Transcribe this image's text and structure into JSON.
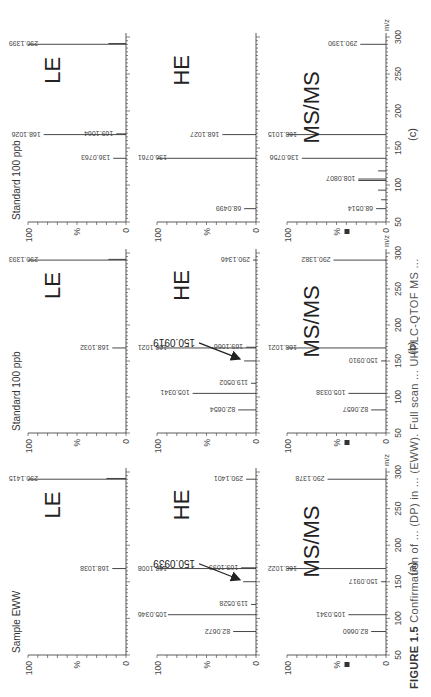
{
  "figure": {
    "caption_label": "FIGURE 1.5",
    "caption_text": "Confirmation of ... (DP) in ... (EWW). Full scan ... UHPLC-QTOF MS ..."
  },
  "chart_data": [
    {
      "type": "bar",
      "subtype": "mass_spectrum",
      "column": "(a)",
      "column_title": "Sample EWW",
      "panel": "LE",
      "xlabel": "m/z",
      "ylabel": "%",
      "xlim": [
        50,
        300
      ],
      "ylim": [
        0,
        100
      ],
      "xticks": [
        50,
        100,
        150,
        200,
        250,
        300
      ],
      "yticks": [
        0,
        100
      ],
      "peaks": [
        {
          "mz": 168.1038,
          "intensity": 14,
          "label": "168.1038"
        },
        {
          "mz": 290.1415,
          "intensity": 100,
          "label": "290.1415"
        },
        {
          "mz": 291.14,
          "intensity": 20
        }
      ]
    },
    {
      "type": "bar",
      "subtype": "mass_spectrum",
      "column": "(a)",
      "panel": "HE",
      "xlabel": "m/z",
      "ylabel": "%",
      "xlim": [
        50,
        300
      ],
      "ylim": [
        0,
        100
      ],
      "xticks": [
        50,
        100,
        150,
        200,
        250,
        300
      ],
      "yticks": [
        0,
        100
      ],
      "annotation": {
        "text": "150.0939",
        "arrow_to_mz": 150.0939
      },
      "peaks": [
        {
          "mz": 82.0672,
          "intensity": 23,
          "label": "82.0672"
        },
        {
          "mz": 105.0346,
          "intensity": 89,
          "label": "105.0346"
        },
        {
          "mz": 119.0528,
          "intensity": 5,
          "label": "119.0528"
        },
        {
          "mz": 150.0939,
          "intensity": 13
        },
        {
          "mz": 168.1008,
          "intensity": 100,
          "label": "168.1008"
        },
        {
          "mz": 169.1099,
          "intensity": 15,
          "label": "169.1099"
        },
        {
          "mz": 290.1401,
          "intensity": 10,
          "label": "290.1401"
        }
      ]
    },
    {
      "type": "bar",
      "subtype": "mass_spectrum",
      "column": "(a)",
      "panel": "MS/MS",
      "xlabel": "m/z",
      "ylabel": "%",
      "xlim": [
        50,
        300
      ],
      "ylim": [
        0,
        100
      ],
      "xticks": [
        50,
        100,
        150,
        200,
        250,
        300
      ],
      "yticks": [
        0,
        100
      ],
      "peaks": [
        {
          "mz": 82.066,
          "intensity": 15,
          "label": "82.0660"
        },
        {
          "mz": 105.0341,
          "intensity": 38,
          "label": "105.0341"
        },
        {
          "mz": 150.0917,
          "intensity": 5,
          "label": "150.0917"
        },
        {
          "mz": 168.1022,
          "intensity": 100,
          "label": "168.1022"
        },
        {
          "mz": 290.1378,
          "intensity": 59,
          "label": "290.1378"
        }
      ]
    },
    {
      "type": "bar",
      "subtype": "mass_spectrum",
      "column": "(b)",
      "column_title": "Standard 100 ppb",
      "panel": "LE",
      "xlabel": "m/z",
      "ylabel": "%",
      "xlim": [
        50,
        300
      ],
      "ylim": [
        0,
        100
      ],
      "xticks": [
        50,
        100,
        150,
        200,
        250,
        300
      ],
      "yticks": [
        0,
        100
      ],
      "peaks": [
        {
          "mz": 168.1032,
          "intensity": 14,
          "label": "168.1032"
        },
        {
          "mz": 290.1393,
          "intensity": 100,
          "label": "290.1393"
        },
        {
          "mz": 291.14,
          "intensity": 18
        }
      ]
    },
    {
      "type": "bar",
      "subtype": "mass_spectrum",
      "column": "(b)",
      "panel": "HE",
      "xlabel": "m/z",
      "ylabel": "%",
      "xlim": [
        50,
        300
      ],
      "ylim": [
        0,
        100
      ],
      "xticks": [
        50,
        100,
        150,
        200,
        250,
        300
      ],
      "yticks": [
        0,
        100
      ],
      "annotation": {
        "text": "150.0919",
        "arrow_to_mz": 150.0919
      },
      "peaks": [
        {
          "mz": 82.0654,
          "intensity": 18,
          "label": "82.0654"
        },
        {
          "mz": 105.0341,
          "intensity": 64,
          "label": "105.0341"
        },
        {
          "mz": 119.0502,
          "intensity": 5,
          "label": "119.0502"
        },
        {
          "mz": 150.0919,
          "intensity": 12
        },
        {
          "mz": 168.1021,
          "intensity": 100,
          "label": "168.1021"
        },
        {
          "mz": 169.1066,
          "intensity": 10,
          "label": "169.1066"
        },
        {
          "mz": 290.1346,
          "intensity": 3,
          "label": "290.1346"
        }
      ]
    },
    {
      "type": "bar",
      "subtype": "mass_spectrum",
      "column": "(b)",
      "panel": "MS/MS",
      "xlabel": "m/z",
      "ylabel": "%",
      "xlim": [
        50,
        300
      ],
      "ylim": [
        0,
        100
      ],
      "xticks": [
        50,
        100,
        150,
        200,
        250,
        300
      ],
      "yticks": [
        0,
        100
      ],
      "peaks": [
        {
          "mz": 82.0657,
          "intensity": 15,
          "label": "82.0657"
        },
        {
          "mz": 105.0338,
          "intensity": 38,
          "label": "105.0338"
        },
        {
          "mz": 150.091,
          "intensity": 5,
          "label": "150.0910"
        },
        {
          "mz": 168.1021,
          "intensity": 100,
          "label": "168.1021"
        },
        {
          "mz": 290.1382,
          "intensity": 53,
          "label": "290.1382"
        }
      ]
    },
    {
      "type": "bar",
      "subtype": "mass_spectrum",
      "column": "(c)",
      "column_title": "Standard 100 ppb",
      "panel": "LE",
      "xlabel": "m/z",
      "ylabel": "%",
      "xlim": [
        50,
        300
      ],
      "ylim": [
        0,
        100
      ],
      "xticks": [
        50,
        100,
        150,
        200,
        250,
        300
      ],
      "yticks": [
        0,
        100
      ],
      "peaks": [
        {
          "mz": 136.0763,
          "intensity": 13,
          "label": "136.0763"
        },
        {
          "mz": 168.1026,
          "intensity": 84,
          "label": "168.1026"
        },
        {
          "mz": 169.1064,
          "intensity": 10,
          "label": "169.1064"
        },
        {
          "mz": 290.1399,
          "intensity": 100,
          "label": "290.1399"
        },
        {
          "mz": 291.14,
          "intensity": 18
        }
      ]
    },
    {
      "type": "bar",
      "subtype": "mass_spectrum",
      "column": "(c)",
      "panel": "HE",
      "xlabel": "m/z",
      "ylabel": "%",
      "xlim": [
        50,
        300
      ],
      "ylim": [
        0,
        100
      ],
      "xticks": [
        50,
        100,
        150,
        200,
        250,
        300
      ],
      "yticks": [
        0,
        100
      ],
      "peaks": [
        {
          "mz": 68.0499,
          "intensity": 12,
          "label": "68.0499"
        },
        {
          "mz": 136.0761,
          "intensity": 100,
          "label": "136.0761"
        },
        {
          "mz": 168.1027,
          "intensity": 34,
          "label": "168.1027"
        }
      ]
    },
    {
      "type": "bar",
      "subtype": "mass_spectrum",
      "column": "(c)",
      "panel": "MS/MS",
      "xlabel": "m/z",
      "ylabel": "%",
      "xlim": [
        50,
        300
      ],
      "ylim": [
        0,
        100
      ],
      "xticks": [
        50,
        100,
        150,
        200,
        250,
        300
      ],
      "yticks": [
        0,
        100
      ],
      "peaks": [
        {
          "mz": 68.0514,
          "intensity": 10,
          "label": "68.0514"
        },
        {
          "mz": 80.05,
          "intensity": 5
        },
        {
          "mz": 93.07,
          "intensity": 8
        },
        {
          "mz": 106.07,
          "intensity": 28
        },
        {
          "mz": 108.0807,
          "intensity": 28,
          "label": "108.0807"
        },
        {
          "mz": 119.06,
          "intensity": 8
        },
        {
          "mz": 136.0756,
          "intensity": 85,
          "label": "136.0756"
        },
        {
          "mz": 168.1015,
          "intensity": 100,
          "label": "168.1015"
        },
        {
          "mz": 290.139,
          "intensity": 26,
          "label": "290.1390"
        }
      ]
    }
  ],
  "layout": {
    "columns": [
      {
        "id": "(a)",
        "x0": 42,
        "x1": 225
      },
      {
        "id": "(b)",
        "x0": 264,
        "x1": 444
      },
      {
        "id": "(c)",
        "x0": 475,
        "x1": 660
      }
    ],
    "rows": [
      {
        "panel": "LE",
        "top": 28,
        "base": 126
      },
      {
        "panel": "HE",
        "top": 157,
        "base": 256
      },
      {
        "panel": "MS/MS",
        "top": 287,
        "base": 386
      }
    ]
  }
}
